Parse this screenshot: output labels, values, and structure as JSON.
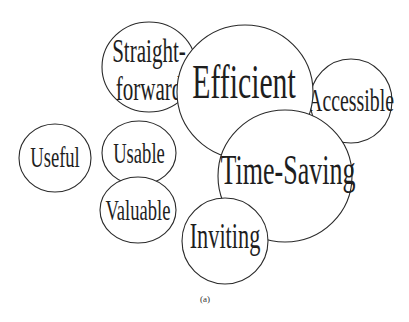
{
  "diagram": {
    "type": "bubble-cluster",
    "caption": "(a)",
    "stroke_color": "#2a2a2a",
    "fill_color": "#ffffff",
    "text_color": "#1e1e1e",
    "bubbles": [
      {
        "id": "straightforward",
        "lines": [
          "Straight-",
          "forward"
        ],
        "label": "Straightforward"
      },
      {
        "id": "accessible",
        "label": "Accessible"
      },
      {
        "id": "efficient",
        "label": "Efficient"
      },
      {
        "id": "time-saving",
        "label": "Time-Saving"
      },
      {
        "id": "inviting",
        "label": "Inviting"
      },
      {
        "id": "useful",
        "label": "Useful"
      },
      {
        "id": "usable",
        "label": "Usable"
      },
      {
        "id": "valuable",
        "label": "Valuable"
      }
    ]
  }
}
